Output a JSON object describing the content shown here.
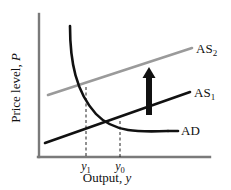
{
  "figure": {
    "kind": "ad-as-macroeconomic-diagram",
    "background_color": "#ffffff"
  },
  "axes": {
    "y_axis": {
      "label_static": "Price level,",
      "label_italic": "P",
      "color": "#7a7a7a",
      "x": 39,
      "y_top": 14,
      "y_bottom": 157
    },
    "x_axis": {
      "label_static": "Output,",
      "label_italic": "y",
      "color": "#7a7a7a",
      "y": 157,
      "x_left": 39,
      "x_right": 210
    },
    "ticks": [
      {
        "name": "y1",
        "base": "y",
        "sub": "1",
        "x": 86
      },
      {
        "name": "y0",
        "base": "y",
        "sub": "0",
        "x": 120
      }
    ]
  },
  "chart_data": {
    "type": "line",
    "title": "",
    "xlabel": "Output, y",
    "ylabel": "Price level, P",
    "grid": false,
    "legend": "inline-curve-labels",
    "xlim": [
      39,
      210
    ],
    "ylim": [
      14,
      157
    ],
    "series": [
      {
        "name": "AD",
        "label": "AD",
        "label_base": "AD",
        "label_sub": "",
        "color": "#111111",
        "width": 2.6,
        "shape": "downward-convex-curve",
        "path": "M 70,26 C 70,62 76,92 96,114 C 114,133 140,132 168,131",
        "label_x": 181,
        "label_y": 135,
        "leader": {
          "x1": 168,
          "y1": 131,
          "x2": 178,
          "y2": 131
        }
      },
      {
        "name": "AS1",
        "label": "AS1",
        "label_base": "AS",
        "label_sub": "1",
        "color": "#111111",
        "width": 2.6,
        "shape": "upward-sloping-line",
        "path": "M 45,143 L 190,92",
        "label_x": 194,
        "label_y": 97,
        "leader": null
      },
      {
        "name": "AS2",
        "label": "AS2",
        "label_base": "AS",
        "label_sub": "2",
        "color": "#9a9a9a",
        "width": 2.6,
        "shape": "upward-sloping-line-shifted-up",
        "path": "M 48,95 L 192,48",
        "label_x": 196,
        "label_y": 53,
        "leader": null
      }
    ],
    "equilibria": [
      {
        "name": "initial-equilibrium",
        "tick": "y0",
        "x": 120,
        "y": 121,
        "curves": [
          "AD",
          "AS1"
        ]
      },
      {
        "name": "new-equilibrium",
        "tick": "y1",
        "x": 86,
        "y": 87,
        "curves": [
          "AD",
          "AS2"
        ]
      }
    ],
    "dropline_color": "#222222",
    "droplines": [
      {
        "name": "dropline-y1",
        "x": 86,
        "y_top": 87,
        "y_bottom": 157
      },
      {
        "name": "dropline-y0",
        "x": 120,
        "y_top": 121,
        "y_bottom": 157
      }
    ],
    "annotations": [
      {
        "name": "shift-up-arrow",
        "type": "arrow",
        "direction": "up",
        "color": "#111111",
        "x": 149,
        "y_tail": 115,
        "y_head": 67,
        "shaft_width": 6,
        "head_width": 13,
        "head_height": 11,
        "meaning": "AS curve shifts upward from AS1 to AS2"
      }
    ]
  }
}
